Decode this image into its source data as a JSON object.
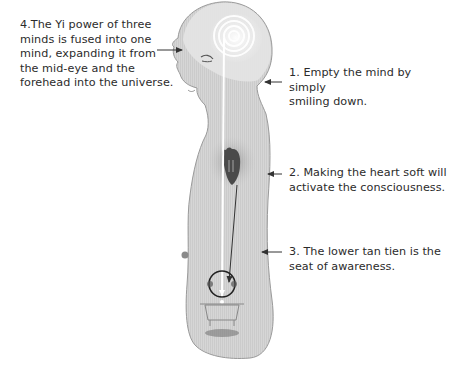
{
  "labels": {
    "four": {
      "lines": [
        "4.The Yi power of three",
        "minds is fused into one",
        "mind, expanding it from",
        "the mid-eye and the",
        "forehead into the universe."
      ]
    },
    "one": {
      "lines": [
        "1. Empty the mind by simply",
        "smiling down."
      ]
    },
    "two": {
      "lines": [
        "2. Making the heart soft will",
        "activate the consciousness."
      ]
    },
    "three": {
      "lines": [
        "3. The lower tan tien is the",
        "seat of awareness."
      ]
    }
  },
  "colors": {
    "body_fill": "#d4d4d4",
    "body_outline": "#9a9a9a",
    "head_fill": "#e6e6e6",
    "heart": "#4a4a4a",
    "arrow": "#333333",
    "energy_line": "#ffffff"
  }
}
